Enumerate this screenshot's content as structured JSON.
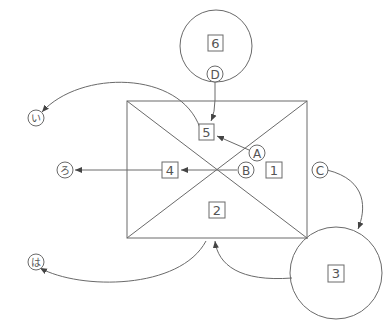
{
  "diagram": {
    "type": "flow-diagram",
    "colors": {
      "line": "#6a6a6a",
      "text": "#555555",
      "background": "#ffffff"
    },
    "rectangle": {
      "x": 127,
      "y": 101,
      "width": 180,
      "height": 137,
      "has_diagonals": true
    },
    "circles": [
      {
        "id": "circle-6",
        "cx": 216,
        "cy": 46,
        "r": 36
      },
      {
        "id": "circle-3",
        "cx": 336,
        "cy": 273,
        "r": 46
      }
    ],
    "boxed_numbers": {
      "n1": "1",
      "n2": "2",
      "n3": "3",
      "n4": "4",
      "n5": "5",
      "n6": "6"
    },
    "circled_letters": {
      "A": "A",
      "B": "B",
      "C": "C",
      "D": "D"
    },
    "circled_kana": {
      "i": "い",
      "ro": "ろ",
      "ha": "は"
    },
    "arrows": [
      {
        "from": "D",
        "to": "5"
      },
      {
        "from": "A",
        "to": "5"
      },
      {
        "from": "B",
        "to": "4"
      },
      {
        "from": "4",
        "to": "ろ"
      },
      {
        "from": "5",
        "to": "い"
      },
      {
        "from": "C",
        "to": "3"
      },
      {
        "from": "3",
        "to": "2"
      },
      {
        "from": "2",
        "to": "は"
      }
    ]
  }
}
